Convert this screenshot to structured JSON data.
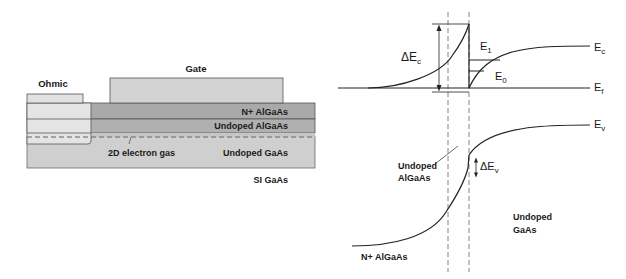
{
  "device": {
    "labels": {
      "gate": "Gate",
      "ohmic": "Ohmic",
      "n_algaas": "N+ AlGaAs",
      "undoped_algaas": "Undoped AlGaAs",
      "two_deg": "2D electron gas",
      "undoped_gaas": "Undoped GaAs",
      "si_gaas": "SI GaAs"
    },
    "colors": {
      "gate": "#d2d2d2",
      "ohmic": "#e4e4e4",
      "n_algaas": "#a9a9a9",
      "undoped_algaas": "#b3b3b3",
      "undoped_gaas": "#cfcfcf",
      "outline": "#555555"
    }
  },
  "band": {
    "labels": {
      "delta_ec": "ΔE",
      "delta_ec_sub": "c",
      "e1": "E",
      "e1_sub": "1",
      "e0": "E",
      "e0_sub": "0",
      "ec": "E",
      "ec_sub": "c",
      "ef": "E",
      "ef_sub": "f",
      "ev": "E",
      "ev_sub": "v",
      "delta_ev": "ΔE",
      "delta_ev_sub": "v",
      "undoped_algaas_line1": "Undoped",
      "undoped_algaas_line2": "AlGaAs",
      "undoped_gaas_line1": "Undoped",
      "undoped_gaas_line2": "GaAs",
      "n_algaas": "N+ AlGaAs"
    }
  }
}
